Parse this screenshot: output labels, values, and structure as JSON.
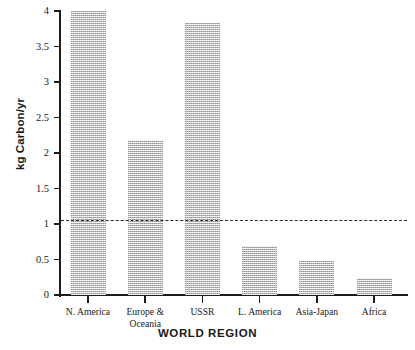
{
  "chart_data": {
    "type": "bar",
    "title": "",
    "xlabel": "WORLD REGION",
    "ylabel": "kg Carbon/yr",
    "categories": [
      "N. America",
      "Europe &\nOceania",
      "USSR",
      "L. America",
      "Asia-Japan",
      "Africa"
    ],
    "values": [
      4.0,
      2.18,
      3.83,
      0.69,
      0.48,
      0.24
    ],
    "ylim": [
      0,
      4
    ],
    "yticks": [
      0,
      0.5,
      1,
      1.5,
      2,
      2.5,
      3,
      3.5,
      4
    ],
    "ytick_labels": [
      "0",
      "0.5",
      "1",
      "1.5",
      "2",
      "2.5",
      "3",
      "3.5",
      "4"
    ],
    "grid": false,
    "legend": false,
    "bar_color": "#b9b9b9",
    "bar_fill": "dithered-gray-halftone",
    "axis_color": "#1c1c1c",
    "annotations": [
      {
        "type": "reference-line",
        "style": "dashed",
        "value": 1.05,
        "color": "#2a2a2a",
        "label": ""
      }
    ]
  },
  "axes": {
    "y_title": "kg Carbon/yr",
    "x_title": "WORLD REGION"
  }
}
